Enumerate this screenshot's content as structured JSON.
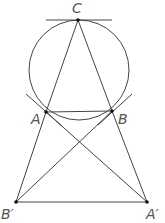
{
  "diagram": {
    "type": "geometry",
    "stroke_color": "#444444",
    "circle": {
      "cx": 79,
      "cy": 70,
      "r": 50
    },
    "points": {
      "C": {
        "label": "C",
        "x": 78,
        "y": 20
      },
      "A": {
        "label": "A",
        "x": 46,
        "y": 112
      },
      "B": {
        "label": "B",
        "x": 112,
        "y": 111
      },
      "B_prime": {
        "label": "B′",
        "x": 16,
        "y": 202
      },
      "A_prime": {
        "label": "A′",
        "x": 147,
        "y": 202
      }
    },
    "segments": [
      [
        "C",
        "A"
      ],
      [
        "C",
        "B"
      ],
      [
        "A",
        "B"
      ],
      [
        "A",
        "B_prime"
      ],
      [
        "B",
        "A_prime"
      ],
      [
        "B_prime",
        "A_prime"
      ],
      [
        "A",
        "A_prime"
      ],
      [
        "B",
        "B_prime"
      ]
    ],
    "tangents": [
      "tangent at C",
      "tangent at A",
      "tangent at B"
    ]
  }
}
